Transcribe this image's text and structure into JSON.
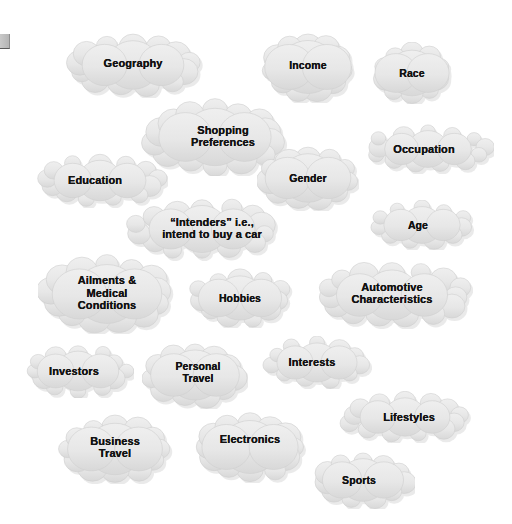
{
  "diagram": {
    "background_color": "#ffffff",
    "cloud_fill_color": "#e8e8e8",
    "cloud_stroke_color": "#cfcfcf",
    "label_color": "#131313",
    "shadow_color": "#b9b9b9"
  },
  "corner_mark": {
    "name": "page-corner-mark",
    "color": "#c2c2c2"
  },
  "clouds": [
    {
      "id": "geography",
      "label": "Geography",
      "x": 62,
      "y": 32,
      "w": 142,
      "h": 66,
      "offset_x": 0,
      "offset_y": -2
    },
    {
      "id": "income",
      "label": "Income",
      "x": 261,
      "y": 31,
      "w": 94,
      "h": 72,
      "offset_x": 0,
      "offset_y": -2
    },
    {
      "id": "race",
      "label": "Race",
      "x": 372,
      "y": 42,
      "w": 80,
      "h": 62,
      "offset_x": 0,
      "offset_y": 0
    },
    {
      "id": "shopping",
      "label": "Shopping\nPreferences",
      "x": 141,
      "y": 98,
      "w": 148,
      "h": 78,
      "offset_x": 8,
      "offset_y": -1
    },
    {
      "id": "occupation",
      "label": "Occupation",
      "x": 362,
      "y": 124,
      "w": 132,
      "h": 50,
      "offset_x": -4,
      "offset_y": 0
    },
    {
      "id": "education",
      "label": "Education",
      "x": 32,
      "y": 153,
      "w": 136,
      "h": 55,
      "offset_x": -5,
      "offset_y": 0
    },
    {
      "id": "gender",
      "label": "Gender",
      "x": 257,
      "y": 145,
      "w": 102,
      "h": 66,
      "offset_x": 0,
      "offset_y": 0
    },
    {
      "id": "intenders",
      "label": "“Intenders” i.e.,\nintend to buy a car",
      "x": 124,
      "y": 197,
      "w": 156,
      "h": 64,
      "offset_x": 10,
      "offset_y": -1
    },
    {
      "id": "age",
      "label": "Age",
      "x": 369,
      "y": 200,
      "w": 106,
      "h": 50,
      "offset_x": -4,
      "offset_y": 0
    },
    {
      "id": "ailments",
      "label": "Ailments &\nMedical\nConditions",
      "x": 38,
      "y": 254,
      "w": 138,
      "h": 80,
      "offset_x": 0,
      "offset_y": -1
    },
    {
      "id": "hobbies",
      "label": "Hobbies",
      "x": 187,
      "y": 268,
      "w": 106,
      "h": 60,
      "offset_x": 0,
      "offset_y": 0
    },
    {
      "id": "automotive",
      "label": "Automotive\nCharacteristics",
      "x": 311,
      "y": 261,
      "w": 162,
      "h": 68,
      "offset_x": 0,
      "offset_y": -2
    },
    {
      "id": "investors",
      "label": "Investors",
      "x": 22,
      "y": 344,
      "w": 112,
      "h": 54,
      "offset_x": -4,
      "offset_y": 0
    },
    {
      "id": "personal-travel",
      "label": "Personal\nTravel",
      "x": 142,
      "y": 341,
      "w": 106,
      "h": 68,
      "offset_x": 3,
      "offset_y": -3
    },
    {
      "id": "interests",
      "label": "Interests",
      "x": 262,
      "y": 336,
      "w": 110,
      "h": 53,
      "offset_x": -5,
      "offset_y": 0
    },
    {
      "id": "lifestyles",
      "label": "Lifestyles",
      "x": 337,
      "y": 391,
      "w": 136,
      "h": 52,
      "offset_x": 4,
      "offset_y": 0
    },
    {
      "id": "business-travel",
      "label": "Business\nTravel",
      "x": 56,
      "y": 414,
      "w": 118,
      "h": 70,
      "offset_x": 0,
      "offset_y": -2
    },
    {
      "id": "electronics",
      "label": "Electronics",
      "x": 191,
      "y": 411,
      "w": 118,
      "h": 72,
      "offset_x": 0,
      "offset_y": -8
    },
    {
      "id": "sports",
      "label": "Sports",
      "x": 311,
      "y": 451,
      "w": 104,
      "h": 58,
      "offset_x": -4,
      "offset_y": 0
    }
  ]
}
